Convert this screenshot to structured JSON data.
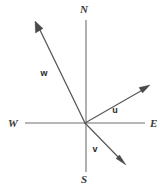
{
  "figure": {
    "background_color": "#ffffff",
    "width": 165,
    "height": 188
  },
  "axes": {
    "stroke_color": "#6e6e6e",
    "stroke_width": 1.1,
    "vertical": {
      "name": "north-south-axis",
      "x1": 86,
      "y1": 20,
      "x2": 86,
      "y2": 172
    },
    "horizontal": {
      "name": "west-east-axis",
      "x1": 25,
      "y1": 123,
      "x2": 145,
      "y2": 123
    },
    "labels": {
      "north": {
        "text": "N",
        "x": 84,
        "y": 13
      },
      "south": {
        "text": "S",
        "x": 84,
        "y": 183
      },
      "west": {
        "text": "W",
        "x": 8,
        "y": 127
      },
      "east": {
        "text": "E",
        "x": 150,
        "y": 127
      }
    }
  },
  "origin": {
    "x": 85,
    "y": 123
  },
  "vectors": [
    {
      "name": "vector-u",
      "label": "u",
      "stroke_color": "#595959",
      "stroke_width": 1.2,
      "tail": {
        "x": 85,
        "y": 123
      },
      "tip": {
        "x": 149,
        "y": 86
      },
      "label_pos": {
        "x": 115,
        "y": 113
      },
      "direction": "up-right toward east-northeast"
    },
    {
      "name": "vector-v",
      "label": "v",
      "stroke_color": "#595959",
      "stroke_width": 1.2,
      "tail": {
        "x": 85,
        "y": 123
      },
      "tip": {
        "x": 125,
        "y": 164
      },
      "label_pos": {
        "x": 95,
        "y": 152
      },
      "direction": "down-right toward southeast"
    },
    {
      "name": "vector-w",
      "label": "w",
      "stroke_color": "#595959",
      "stroke_width": 1.3,
      "tail": {
        "x": 85,
        "y": 123
      },
      "tip": {
        "x": 36,
        "y": 23
      },
      "label_pos": {
        "x": 44,
        "y": 76
      },
      "direction": "up-left toward north-northwest"
    }
  ]
}
